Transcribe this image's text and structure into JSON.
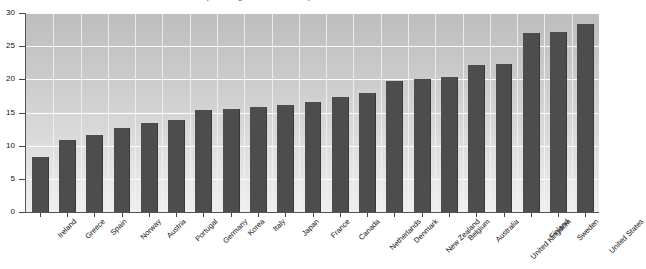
{
  "chart_data": {
    "type": "bar",
    "title": "as a percentage of total health expenditure, selected countries",
    "xlabel": "",
    "ylabel": "",
    "ylim": [
      0,
      30
    ],
    "yticks": [
      0,
      5,
      10,
      15,
      20,
      25,
      30
    ],
    "grid": true,
    "legend": "none",
    "bar_color": "#4d4d4d",
    "categories": [
      "Ireland",
      "Greece",
      "Spain",
      "Norway",
      "Austria",
      "Portugal",
      "Germany",
      "Korea",
      "Italy",
      "Japan",
      "France",
      "Canada",
      "Netherlands",
      "Denmark",
      "New Zealand",
      "Belgium",
      "Australia",
      "United Kingdom",
      "Finland",
      "Sweden",
      "United States"
    ],
    "values": [
      8.3,
      10.9,
      11.6,
      12.7,
      13.4,
      13.8,
      15.4,
      15.6,
      15.9,
      16.1,
      16.6,
      17.3,
      18.0,
      19.8,
      20.0,
      20.3,
      22.1,
      22.3,
      27.0,
      27.1,
      28.3
    ]
  }
}
